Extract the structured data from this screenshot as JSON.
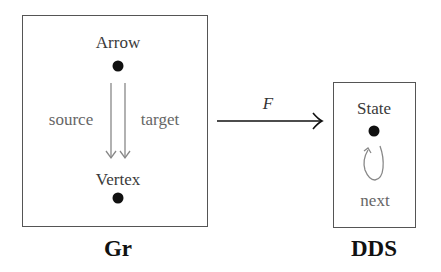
{
  "diagram": {
    "source_category": {
      "title": "Gr",
      "objects": [
        {
          "label": "Arrow"
        },
        {
          "label": "Vertex"
        }
      ],
      "morphisms": [
        {
          "label": "source",
          "from": "Arrow",
          "to": "Vertex"
        },
        {
          "label": "target",
          "from": "Arrow",
          "to": "Vertex"
        }
      ]
    },
    "functor": {
      "label": "F"
    },
    "target_category": {
      "title": "DDS",
      "objects": [
        {
          "label": "State"
        }
      ],
      "morphisms": [
        {
          "label": "next",
          "from": "State",
          "to": "State"
        }
      ]
    },
    "colors": {
      "box_border": "#555555",
      "dot": "#111111",
      "morphism_arrow": "#888888",
      "functor_arrow": "#111111"
    }
  }
}
